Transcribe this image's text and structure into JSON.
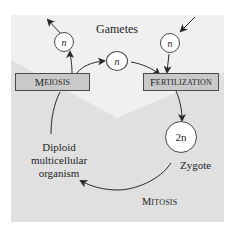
{
  "colors": {
    "panel_light": "#efefef",
    "panel_dark": "#e0e0e0",
    "box_fill": "#c9c9c9",
    "stroke": "#3a3a3a",
    "text": "#1e1e1e"
  },
  "labels": {
    "gametes": "Gametes",
    "zygote": "Zygote",
    "organism_line1": "Diploid",
    "organism_line2": "multicellular",
    "organism_line3": "organism"
  },
  "processes": {
    "meiosis": {
      "first": "M",
      "rest": "EIOSIS"
    },
    "fertilization": {
      "first": "F",
      "rest": "ERTILIZATION"
    },
    "mitosis": {
      "first": "M",
      "rest": "ITOSIS"
    }
  },
  "cells": {
    "gamete_out": "n",
    "gamete_transfer": "n",
    "gamete_in": "n",
    "zygote": "2n"
  }
}
